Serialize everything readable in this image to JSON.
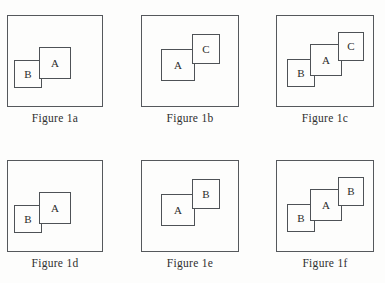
{
  "figure": {
    "background_color": "#fdfdfc",
    "frame_color": "#55585c",
    "box_border_color": "#4e5256",
    "label_color": "#2b2b2b",
    "panels": [
      {
        "id": "figure-1a",
        "caption": "Figure 1a",
        "frame": {
          "x": 7,
          "y": 15,
          "w": 96,
          "h": 92
        },
        "caption_y": 112,
        "boxes": [
          {
            "label": "B",
            "x": 6,
            "y": 44,
            "w": 28,
            "h": 28
          },
          {
            "label": "A",
            "x": 31,
            "y": 31,
            "w": 32,
            "h": 32
          }
        ]
      },
      {
        "id": "figure-1b",
        "caption": "Figure 1b",
        "frame": {
          "x": 141,
          "y": 15,
          "w": 98,
          "h": 92
        },
        "caption_y": 112,
        "boxes": [
          {
            "label": "A",
            "x": 19,
            "y": 33,
            "w": 34,
            "h": 32
          },
          {
            "label": "C",
            "x": 50,
            "y": 18,
            "w": 28,
            "h": 30
          }
        ]
      },
      {
        "id": "figure-1c",
        "caption": "Figure 1c",
        "frame": {
          "x": 276,
          "y": 15,
          "w": 98,
          "h": 92
        },
        "caption_y": 112,
        "boxes": [
          {
            "label": "B",
            "x": 10,
            "y": 43,
            "w": 28,
            "h": 28
          },
          {
            "label": "A",
            "x": 33,
            "y": 28,
            "w": 32,
            "h": 32
          },
          {
            "label": "C",
            "x": 61,
            "y": 16,
            "w": 26,
            "h": 29
          }
        ]
      },
      {
        "id": "figure-1d",
        "caption": "Figure 1d",
        "frame": {
          "x": 7,
          "y": 160,
          "w": 96,
          "h": 92
        },
        "caption_y": 257,
        "boxes": [
          {
            "label": "B",
            "x": 6,
            "y": 44,
            "w": 28,
            "h": 28
          },
          {
            "label": "A",
            "x": 31,
            "y": 31,
            "w": 32,
            "h": 32
          }
        ]
      },
      {
        "id": "figure-1e",
        "caption": "Figure 1e",
        "frame": {
          "x": 141,
          "y": 160,
          "w": 98,
          "h": 92
        },
        "caption_y": 257,
        "boxes": [
          {
            "label": "A",
            "x": 19,
            "y": 33,
            "w": 34,
            "h": 32
          },
          {
            "label": "B",
            "x": 50,
            "y": 18,
            "w": 28,
            "h": 30
          }
        ]
      },
      {
        "id": "figure-1f",
        "caption": "Figure 1f",
        "frame": {
          "x": 276,
          "y": 160,
          "w": 98,
          "h": 92
        },
        "caption_y": 257,
        "boxes": [
          {
            "label": "B",
            "x": 10,
            "y": 43,
            "w": 28,
            "h": 28
          },
          {
            "label": "A",
            "x": 33,
            "y": 28,
            "w": 32,
            "h": 32
          },
          {
            "label": "B",
            "x": 61,
            "y": 16,
            "w": 26,
            "h": 29
          }
        ]
      }
    ]
  }
}
